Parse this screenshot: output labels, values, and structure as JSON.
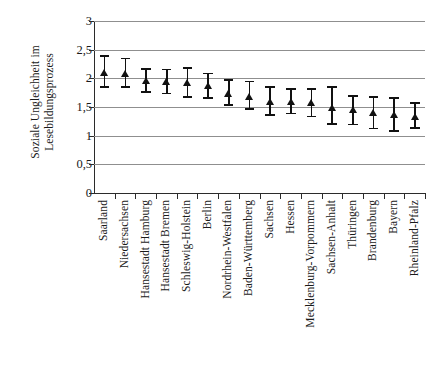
{
  "chart_data": {
    "type": "scatter",
    "title": "",
    "subtitle": "",
    "xlabel": "",
    "ylabel_lines": [
      "Soziale Ungleichheit im",
      "Lesebildungsprozess"
    ],
    "ylabel": "Soziale Ungleichheit im Lesebildungsprozess",
    "ylim": [
      0,
      3
    ],
    "yticks": [
      0,
      0.5,
      1,
      1.5,
      2,
      2.5,
      3
    ],
    "ytick_labels": [
      "0",
      "0,5",
      "1",
      "1,5",
      "2",
      "2,5",
      "3"
    ],
    "grid": "horizontal",
    "legend": "none",
    "error_bars": "vertical with caps (95% confidence interval)",
    "marker": "filled black triangle",
    "categories": [
      "Saarland",
      "Niedersachsen",
      "Hansestadt Hamburg",
      "Hansestadt Bremen",
      "Schleswig-Holstein",
      "Berlin",
      "Nordrhein-Westfalen",
      "Baden-Württemberg",
      "Sachsen",
      "Hessen",
      "Mecklenburg-Vorpommern",
      "Sachsen-Anhalt",
      "Thüringen",
      "Brandenburg",
      "Bayern",
      "Rheinland-Pfalz"
    ],
    "values": [
      2.1,
      2.08,
      1.96,
      1.95,
      1.93,
      1.87,
      1.74,
      1.69,
      1.6,
      1.6,
      1.57,
      1.5,
      1.45,
      1.4,
      1.37,
      1.34
    ],
    "err_low": [
      1.83,
      1.83,
      1.74,
      1.72,
      1.66,
      1.64,
      1.52,
      1.45,
      1.34,
      1.37,
      1.32,
      1.19,
      1.18,
      1.11,
      1.07,
      1.12
    ],
    "err_high": [
      2.41,
      2.36,
      2.18,
      2.17,
      2.19,
      2.1,
      1.98,
      1.96,
      1.87,
      1.83,
      1.83,
      1.87,
      1.71,
      1.69,
      1.67,
      1.58
    ],
    "points": [
      {
        "category": "Saarland",
        "value": 2.1,
        "low": 1.83,
        "high": 2.41
      },
      {
        "category": "Niedersachsen",
        "value": 2.08,
        "low": 1.83,
        "high": 2.36
      },
      {
        "category": "Hansestadt Hamburg",
        "value": 1.96,
        "low": 1.74,
        "high": 2.18
      },
      {
        "category": "Hansestadt Bremen",
        "value": 1.95,
        "low": 1.72,
        "high": 2.17
      },
      {
        "category": "Schleswig-Holstein",
        "value": 1.93,
        "low": 1.66,
        "high": 2.19
      },
      {
        "category": "Berlin",
        "value": 1.87,
        "low": 1.64,
        "high": 2.1
      },
      {
        "category": "Nordrhein-Westfalen",
        "value": 1.74,
        "low": 1.52,
        "high": 1.98
      },
      {
        "category": "Baden-Württemberg",
        "value": 1.69,
        "low": 1.45,
        "high": 1.96
      },
      {
        "category": "Sachsen",
        "value": 1.6,
        "low": 1.34,
        "high": 1.87
      },
      {
        "category": "Hessen",
        "value": 1.6,
        "low": 1.37,
        "high": 1.83
      },
      {
        "category": "Mecklenburg-Vorpommern",
        "value": 1.57,
        "low": 1.32,
        "high": 1.83
      },
      {
        "category": "Sachsen-Anhalt",
        "value": 1.5,
        "low": 1.19,
        "high": 1.87
      },
      {
        "category": "Thüringen",
        "value": 1.45,
        "low": 1.18,
        "high": 1.71
      },
      {
        "category": "Brandenburg",
        "value": 1.4,
        "low": 1.11,
        "high": 1.69
      },
      {
        "category": "Bayern",
        "value": 1.37,
        "low": 1.07,
        "high": 1.67
      },
      {
        "category": "Rheinland-Pfalz",
        "value": 1.34,
        "low": 1.12,
        "high": 1.58
      }
    ],
    "colors": {
      "marker": "#111111",
      "errorbar": "#111111",
      "gridline": "#8f8f8f",
      "axis": "#2b2b2b",
      "background": "#ffffff",
      "text": "#1a1a1a"
    }
  }
}
